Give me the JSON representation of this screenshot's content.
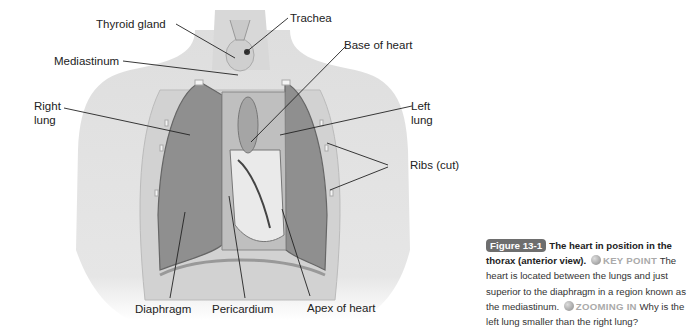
{
  "diagram": {
    "labels": {
      "thyroid_gland": "Thyroid gland",
      "trachea": "Trachea",
      "base_of_heart": "Base of heart",
      "mediastinum": "Mediastinum",
      "right_lung": "Right\nlung",
      "right_lung_l1": "Right",
      "right_lung_l2": "lung",
      "left_lung_l1": "Left",
      "left_lung_l2": "lung",
      "ribs": "Ribs (cut)",
      "diaphragm": "Diaphragm",
      "pericardium": "Pericardium",
      "apex": "Apex of heart"
    }
  },
  "caption": {
    "figure_number": "Figure 13-1",
    "title": "The heart in position in the thorax (anterior view).",
    "key_point_label": "KEY POINT",
    "key_point_text": "The heart is located between the lungs and just superior to the diaphragm in a region known as the mediastinum.",
    "zooming_label": "ZOOMING IN",
    "zooming_text": "Why is the left lung smaller than the right lung?"
  }
}
